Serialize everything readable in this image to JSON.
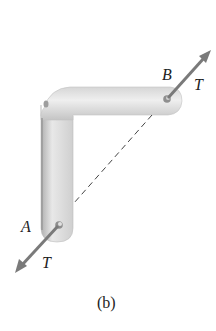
{
  "figure": {
    "caption": "(b)",
    "labels": {
      "point_a": "A",
      "point_b": "B",
      "force_at_b": "T",
      "force_at_a": "T"
    },
    "colors": {
      "bracket_light": "#e4e4e4",
      "bracket_dark": "#b8b8b8",
      "arrow": "#7a7a7a",
      "dashed_line": "#444444",
      "text": "#222222"
    }
  }
}
